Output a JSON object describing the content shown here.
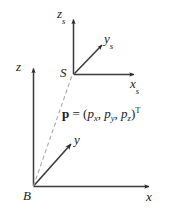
{
  "figure": {
    "name": "coordinate-frames-diagram",
    "background_color": "#ffffff",
    "stroke_color": "#2b2b2b",
    "dashed_color": "#9a9a9a",
    "frames": {
      "base": {
        "origin_label": "B",
        "axes": [
          {
            "name": "x",
            "label": "x"
          },
          {
            "name": "y",
            "label": "y"
          },
          {
            "name": "z",
            "label": "z"
          }
        ]
      },
      "sensor": {
        "origin_label": "S",
        "origin_subscript": "",
        "axes": [
          {
            "name": "x_s",
            "label": "x",
            "subscript": "s"
          },
          {
            "name": "y_s",
            "label": "y",
            "subscript": "s"
          },
          {
            "name": "z_s",
            "label": "z",
            "subscript": "s"
          }
        ]
      }
    },
    "equation": {
      "vector_symbol": "p",
      "equals": "=",
      "open_paren": "(",
      "component_x": "p",
      "component_x_sub": "x",
      "comma_1": ",",
      "component_y": "p",
      "component_y_sub": "y",
      "comma_2": ",",
      "component_z": "p",
      "component_z_sub": "z",
      "close_paren": ")",
      "transpose": "T",
      "full_text": "p = (px, py, pz)T"
    }
  }
}
